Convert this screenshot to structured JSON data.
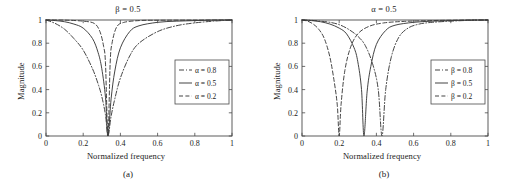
{
  "figure": {
    "background": "#ffffff",
    "line_color": "#3a3a3a",
    "axis_color": "#4a4a4a"
  },
  "panels": [
    {
      "id": "a",
      "title": "β = 0.5",
      "caption": "(a)",
      "xlabel": "Normalized frequency",
      "ylabel": "Magnitude",
      "xticks": [
        "0",
        "0.2",
        "0.4",
        "0.6",
        "0.8",
        "1"
      ],
      "yticks": [
        "0",
        "0.2",
        "0.4",
        "0.6",
        "0.8",
        "1"
      ],
      "legend": [
        {
          "label": "α = 0.8",
          "style": "dashdot"
        },
        {
          "label": "α = 0.5",
          "style": "solid"
        },
        {
          "label": "α = 0.2",
          "style": "dashed"
        }
      ]
    },
    {
      "id": "b",
      "title": "α = 0.5",
      "caption": "(b)",
      "xlabel": "Normalized frequency",
      "ylabel": "Magnitude",
      "xticks": [
        "0",
        "0.2",
        "0.4",
        "0.6",
        "0.8",
        "1"
      ],
      "yticks": [
        "0",
        "0.2",
        "0.4",
        "0.6",
        "0.8",
        "1"
      ],
      "legend": [
        {
          "label": "β = 0.8",
          "style": "dashdot"
        },
        {
          "label": "β = 0.5",
          "style": "solid"
        },
        {
          "label": "β = 0.2",
          "style": "dashed"
        }
      ]
    }
  ],
  "chart_data": [
    {
      "type": "line",
      "panel": "a",
      "title": "β = 0.5",
      "caption": "(a)",
      "xlabel": "Normalized frequency",
      "ylabel": "Magnitude",
      "xlim": [
        0,
        1
      ],
      "ylim": [
        0,
        1
      ],
      "xticks": [
        0,
        0.2,
        0.4,
        0.6,
        0.8,
        1
      ],
      "yticks": [
        0,
        0.2,
        0.4,
        0.6,
        0.8,
        1
      ],
      "grid": false,
      "legend_position": "right",
      "notch_frequency": 0.333,
      "series": [
        {
          "name": "α = 0.8",
          "style": "dashdot",
          "notch": 0.333,
          "bandwidth": 0.3,
          "x": [
            0,
            0.05,
            0.1,
            0.15,
            0.2,
            0.25,
            0.28,
            0.3,
            0.32,
            0.333,
            0.35,
            0.37,
            0.4,
            0.45,
            0.5,
            0.6,
            0.7,
            0.8,
            0.9,
            1.0
          ],
          "y": [
            1.0,
            0.97,
            0.92,
            0.84,
            0.74,
            0.58,
            0.45,
            0.34,
            0.18,
            0.0,
            0.17,
            0.32,
            0.5,
            0.69,
            0.8,
            0.9,
            0.95,
            0.975,
            0.99,
            1.0
          ]
        },
        {
          "name": "α = 0.5",
          "style": "solid",
          "notch": 0.333,
          "bandwidth": 0.14,
          "x": [
            0,
            0.05,
            0.1,
            0.15,
            0.2,
            0.25,
            0.28,
            0.3,
            0.32,
            0.333,
            0.35,
            0.37,
            0.4,
            0.45,
            0.5,
            0.6,
            0.7,
            0.8,
            0.9,
            1.0
          ],
          "y": [
            1.0,
            0.995,
            0.985,
            0.965,
            0.93,
            0.84,
            0.72,
            0.58,
            0.33,
            0.0,
            0.32,
            0.56,
            0.76,
            0.9,
            0.95,
            0.98,
            0.99,
            0.995,
            0.999,
            1.0
          ]
        },
        {
          "name": "α = 0.2",
          "style": "dashed",
          "notch": 0.333,
          "bandwidth": 0.045,
          "x": [
            0,
            0.1,
            0.2,
            0.26,
            0.29,
            0.31,
            0.32,
            0.333,
            0.345,
            0.355,
            0.38,
            0.42,
            0.5,
            0.6,
            0.8,
            1.0
          ],
          "y": [
            1.0,
            0.999,
            0.99,
            0.97,
            0.9,
            0.77,
            0.62,
            0.0,
            0.63,
            0.8,
            0.94,
            0.98,
            0.995,
            0.998,
            0.999,
            1.0
          ]
        }
      ]
    },
    {
      "type": "line",
      "panel": "b",
      "title": "α = 0.5",
      "caption": "(b)",
      "xlabel": "Normalized frequency",
      "ylabel": "Magnitude",
      "xlim": [
        0,
        1
      ],
      "ylim": [
        0,
        1
      ],
      "xticks": [
        0,
        0.2,
        0.4,
        0.6,
        0.8,
        1
      ],
      "yticks": [
        0,
        0.2,
        0.4,
        0.6,
        0.8,
        1
      ],
      "grid": false,
      "legend_position": "right",
      "series": [
        {
          "name": "β = 0.8",
          "style": "dashdot",
          "notch": 0.43,
          "bandwidth": 0.15,
          "x": [
            0,
            0.05,
            0.1,
            0.15,
            0.2,
            0.25,
            0.3,
            0.34,
            0.38,
            0.41,
            0.43,
            0.45,
            0.48,
            0.52,
            0.57,
            0.63,
            0.7,
            0.8,
            0.9,
            1.0
          ],
          "y": [
            1.0,
            0.997,
            0.99,
            0.98,
            0.96,
            0.92,
            0.86,
            0.78,
            0.62,
            0.4,
            0.0,
            0.4,
            0.68,
            0.85,
            0.93,
            0.965,
            0.98,
            0.99,
            0.997,
            1.0
          ]
        },
        {
          "name": "β = 0.5",
          "style": "solid",
          "notch": 0.333,
          "bandwidth": 0.15,
          "x": [
            0,
            0.05,
            0.1,
            0.15,
            0.2,
            0.24,
            0.28,
            0.3,
            0.32,
            0.333,
            0.35,
            0.37,
            0.4,
            0.45,
            0.5,
            0.6,
            0.7,
            0.8,
            0.9,
            1.0
          ],
          "y": [
            1.0,
            0.995,
            0.985,
            0.965,
            0.93,
            0.88,
            0.76,
            0.64,
            0.4,
            0.0,
            0.38,
            0.6,
            0.79,
            0.91,
            0.955,
            0.98,
            0.99,
            0.995,
            0.999,
            1.0
          ]
        },
        {
          "name": "β = 0.2",
          "style": "dashed",
          "notch": 0.2,
          "bandwidth": 0.15,
          "x": [
            0,
            0.03,
            0.06,
            0.09,
            0.12,
            0.15,
            0.175,
            0.19,
            0.2,
            0.21,
            0.23,
            0.26,
            0.3,
            0.36,
            0.44,
            0.55,
            0.7,
            0.85,
            1.0
          ],
          "y": [
            1.0,
            0.99,
            0.965,
            0.92,
            0.84,
            0.68,
            0.45,
            0.26,
            0.0,
            0.27,
            0.56,
            0.76,
            0.88,
            0.945,
            0.975,
            0.988,
            0.995,
            0.999,
            1.0
          ]
        }
      ]
    }
  ]
}
